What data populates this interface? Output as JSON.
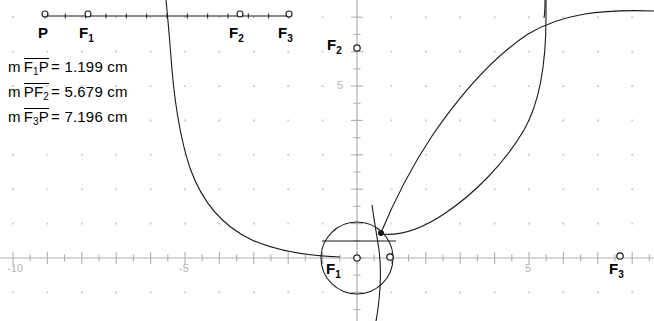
{
  "app": {
    "title": "Dynamic Geometry Sketch",
    "background_color": "#ffffff",
    "ink_color": "#000000",
    "grid_color": "#c8c8c8",
    "axis_color": "#b0b0b0"
  },
  "measurements": [
    {
      "name": "measure-f1p",
      "m": "m",
      "seg_a": "F",
      "seg_a_sub": "1",
      "seg_b": "P",
      "seg_b_sub": "",
      "equals": "=",
      "value": "1.199",
      "unit": "cm"
    },
    {
      "name": "measure-pf2",
      "m": "m",
      "seg_a": "P",
      "seg_a_sub": "",
      "seg_b": "F",
      "seg_b_sub": "2",
      "equals": "=",
      "value": "5.679",
      "unit": "cm"
    },
    {
      "name": "measure-f3p",
      "m": "m",
      "seg_a": "F",
      "seg_a_sub": "3",
      "seg_b": "P",
      "seg_b_sub": "",
      "equals": "=",
      "value": "7.196",
      "unit": "cm"
    }
  ],
  "ruler": {
    "label": "measurement-ruler",
    "y_px": 16,
    "x_start_px": 45,
    "x_end_px": 289,
    "points": [
      {
        "id": "P",
        "base": "P",
        "sub": "",
        "x_px": 45,
        "label_x_px": 38,
        "label_y_px": 26
      },
      {
        "id": "F1",
        "base": "F",
        "sub": "1",
        "x_px": 88,
        "label_x_px": 80,
        "label_y_px": 26
      },
      {
        "id": "F2",
        "base": "F",
        "sub": "2",
        "x_px": 240,
        "label_x_px": 230,
        "label_y_px": 26
      },
      {
        "id": "F3",
        "base": "F",
        "sub": "3",
        "x_px": 289,
        "label_x_px": 279,
        "label_y_px": 26
      }
    ]
  },
  "plane_labels": [
    {
      "id": "F2-plane",
      "base": "F",
      "sub": "2",
      "x_px": 329,
      "label_y_px": 36,
      "pt_x_px": 357,
      "pt_y_px": 48
    },
    {
      "id": "F1-plane",
      "base": "F",
      "sub": "1",
      "x_px": 328,
      "label_y_px": 262,
      "pt_x_px": 357,
      "pt_y_px": 258
    },
    {
      "id": "F3-plane",
      "base": "F",
      "sub": "3",
      "x_px": 610,
      "label_y_px": 262,
      "pt_x_px": 620,
      "pt_y_px": 257
    }
  ],
  "axes": {
    "x_axis_y_px": 258,
    "y_axis_x_px": 357,
    "unit_px": 34.4,
    "minor_tick_units": 0.5,
    "x_ticks": [
      {
        "value": "-10",
        "x_px": 15,
        "label_x_px": 8,
        "label_y_px": 263
      },
      {
        "value": "-5",
        "x_px": 187,
        "label_x_px": 180,
        "label_y_px": 263
      },
      {
        "value": "5",
        "x_px": 529,
        "label_x_px": 524,
        "label_y_px": 263
      }
    ],
    "y_ticks": [
      {
        "value": "5",
        "y_px": 85,
        "label_x_px": 336,
        "label_y_px": 79
      }
    ]
  },
  "objects": {
    "circle": {
      "name": "circle-about-F1",
      "cx_px": 357,
      "cy_px": 258,
      "r_px": 36
    },
    "point_on_circle_right": {
      "name": "point-on-circle-x-axis",
      "x_px": 390,
      "y_px": 257
    },
    "point_on_circle_upper": {
      "name": "point-on-circle-upper",
      "x_px": 381,
      "y_px": 233
    },
    "curve_left": {
      "name": "hyperbola-branch-left"
    },
    "curve_lens_outer": {
      "name": "ellipse-arc-outer"
    },
    "curve_lens_inner": {
      "name": "conic-arc-inner"
    },
    "curve_vertical_right": {
      "name": "hyperbola-branch-right"
    },
    "chord": {
      "name": "horizontal-chord-through-circle"
    }
  }
}
